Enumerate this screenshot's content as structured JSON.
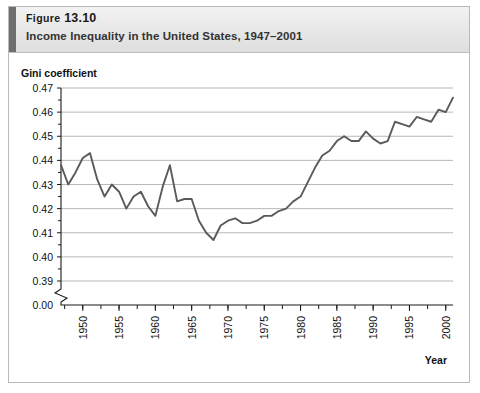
{
  "figure": {
    "number_prefix": "Figure",
    "number": "13.10",
    "subtitle": "Income Inequality in the United States, 1947–2001"
  },
  "axes": {
    "y_title": "Gini coefficient",
    "x_title": "Year",
    "y_ticks": [
      "0.47",
      "0.46",
      "0.45",
      "0.44",
      "0.43",
      "0.42",
      "0.41",
      "0.40",
      "0.39",
      "0.00"
    ],
    "x_ticks": [
      "1950",
      "1955",
      "1960",
      "1965",
      "1970",
      "1975",
      "1980",
      "1985",
      "1990",
      "1995",
      "2000"
    ],
    "has_axis_break": true,
    "break_between": [
      "0.39",
      "0.00"
    ]
  },
  "style": {
    "line_color": "#5a5a5a",
    "gridline_color": "#9a9a9a",
    "axis_color": "#1a1a1a",
    "header_bar_color": "#6e6e6e",
    "header_background": "#e9e9e9",
    "frame_color": "#b9b9b9",
    "plot_background": "#ffffff"
  },
  "chart_data": {
    "type": "line",
    "title": "Income Inequality in the United States, 1947–2001",
    "xlabel": "Year",
    "ylabel": "Gini coefficient",
    "xlim": [
      1947,
      2001
    ],
    "ylim": [
      0.39,
      0.47
    ],
    "grid": true,
    "legend": "none",
    "series": [
      {
        "name": "Gini coefficient",
        "x": [
          1947,
          1948,
          1949,
          1950,
          1951,
          1952,
          1953,
          1954,
          1955,
          1956,
          1957,
          1958,
          1959,
          1960,
          1961,
          1962,
          1963,
          1964,
          1965,
          1966,
          1967,
          1968,
          1969,
          1970,
          1971,
          1972,
          1973,
          1974,
          1975,
          1976,
          1977,
          1978,
          1979,
          1980,
          1981,
          1982,
          1983,
          1984,
          1985,
          1986,
          1987,
          1988,
          1989,
          1990,
          1991,
          1992,
          1993,
          1994,
          1995,
          1996,
          1997,
          1998,
          1999,
          2000,
          2001
        ],
        "values": [
          0.438,
          0.43,
          0.435,
          0.441,
          0.443,
          0.432,
          0.425,
          0.43,
          0.427,
          0.42,
          0.425,
          0.427,
          0.421,
          0.417,
          0.429,
          0.438,
          0.423,
          0.424,
          0.424,
          0.415,
          0.41,
          0.407,
          0.413,
          0.415,
          0.416,
          0.414,
          0.414,
          0.415,
          0.417,
          0.417,
          0.419,
          0.42,
          0.423,
          0.425,
          0.431,
          0.437,
          0.442,
          0.444,
          0.448,
          0.45,
          0.448,
          0.448,
          0.452,
          0.449,
          0.447,
          0.448,
          0.456,
          0.455,
          0.454,
          0.458,
          0.457,
          0.456,
          0.461,
          0.46,
          0.466
        ]
      }
    ]
  }
}
